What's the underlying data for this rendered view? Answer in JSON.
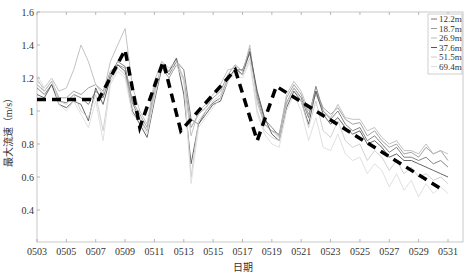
{
  "chart_data": {
    "type": "line",
    "title": "",
    "xlabel": "日期",
    "ylabel": "最大流速（m/s）",
    "ylim": [
      0.2,
      1.6
    ],
    "xlim": [
      "0503",
      "0531"
    ],
    "grid": false,
    "legend_position": "upper right",
    "x_ticks": [
      "0503",
      "0505",
      "0507",
      "0509",
      "0511",
      "0513",
      "0515",
      "0517",
      "0519",
      "0521",
      "0523",
      "0525",
      "0527",
      "0529",
      "0531"
    ],
    "y_ticks": [
      0.4,
      0.6,
      0.8,
      1,
      1.2,
      1.4,
      1.6
    ],
    "y_tick_labels": [
      "0.4",
      "0.6",
      "0.8",
      "1",
      "1.2",
      "1.4",
      "1.6"
    ],
    "x_day_values": [
      3,
      3.5,
      4,
      4.5,
      5,
      5.5,
      6,
      6.5,
      7,
      7.5,
      8,
      8.5,
      9,
      9.5,
      10,
      10.5,
      11,
      11.5,
      12,
      12.5,
      13,
      13.5,
      14,
      14.5,
      15,
      15.5,
      16,
      16.5,
      17,
      17.5,
      18,
      18.5,
      19,
      19.5,
      20,
      20.5,
      21,
      21.5,
      22,
      22.5,
      23,
      23.5,
      24,
      24.5,
      25,
      25.5,
      26,
      26.5,
      27,
      27.5,
      28,
      28.5,
      29,
      29.5,
      30,
      30.5,
      31
    ],
    "series": [
      {
        "name": "12.2m",
        "color": "#777777",
        "values": [
          1.14,
          1.1,
          1.16,
          1.06,
          1.05,
          1.1,
          1.08,
          1.04,
          1.12,
          1.08,
          1.22,
          1.3,
          1.27,
          1.05,
          0.95,
          0.88,
          1.1,
          1.28,
          1.22,
          1.3,
          1.25,
          0.95,
          0.92,
          1.0,
          1.05,
          1.08,
          1.2,
          1.25,
          1.25,
          1.35,
          1.1,
          0.95,
          0.9,
          0.85,
          1.05,
          1.14,
          1.08,
          0.96,
          1.15,
          1.0,
          0.95,
          1.0,
          0.92,
          0.88,
          0.9,
          0.82,
          0.85,
          0.8,
          0.75,
          0.78,
          0.72,
          0.72,
          0.7,
          0.72,
          0.68,
          0.7,
          0.66
        ]
      },
      {
        "name": "18.7m",
        "color": "#999999",
        "values": [
          1.16,
          1.12,
          1.18,
          1.08,
          1.08,
          1.12,
          1.1,
          1.14,
          1.16,
          1.12,
          1.24,
          1.28,
          1.26,
          1.06,
          0.98,
          0.9,
          1.14,
          1.26,
          1.2,
          1.28,
          1.2,
          0.9,
          0.98,
          1.02,
          1.08,
          1.12,
          1.22,
          1.28,
          1.24,
          1.38,
          1.08,
          0.92,
          0.88,
          0.86,
          1.08,
          1.16,
          1.1,
          0.98,
          1.12,
          1.02,
          0.98,
          1.02,
          0.95,
          0.92,
          0.93,
          0.85,
          0.88,
          0.82,
          0.78,
          0.8,
          0.74,
          0.75,
          0.72,
          0.78,
          0.74,
          0.76,
          0.7
        ]
      },
      {
        "name": "26.9m",
        "color": "#bbbbbb",
        "values": [
          1.18,
          1.14,
          1.2,
          1.12,
          1.14,
          1.25,
          1.4,
          1.3,
          1.16,
          1.1,
          1.3,
          1.4,
          1.5,
          1.15,
          1.0,
          0.92,
          1.18,
          1.3,
          1.24,
          1.32,
          1.18,
          0.85,
          1.0,
          1.04,
          1.1,
          1.16,
          1.25,
          1.26,
          1.22,
          1.4,
          1.05,
          0.92,
          0.88,
          0.84,
          1.1,
          1.18,
          1.12,
          1.0,
          1.1,
          1.0,
          0.96,
          1.04,
          0.96,
          0.95,
          0.95,
          0.88,
          0.9,
          0.84,
          0.8,
          0.82,
          0.76,
          0.76,
          0.74,
          0.8,
          0.74,
          0.76,
          0.74
        ]
      },
      {
        "name": "37.6m",
        "color": "#555555",
        "values": [
          1.1,
          1.08,
          1.16,
          1.04,
          1.02,
          1.06,
          1.04,
          0.94,
          1.14,
          1.04,
          1.2,
          1.28,
          1.24,
          1.0,
          0.92,
          0.84,
          1.06,
          1.26,
          1.24,
          1.32,
          1.1,
          0.68,
          0.92,
          0.98,
          1.04,
          1.06,
          1.18,
          1.26,
          1.22,
          1.36,
          1.12,
          0.96,
          0.86,
          0.82,
          1.02,
          1.12,
          1.06,
          0.92,
          1.12,
          0.98,
          0.92,
          0.96,
          0.9,
          0.86,
          0.88,
          0.8,
          0.82,
          0.78,
          0.72,
          0.74,
          0.7,
          0.7,
          0.68,
          0.66,
          0.64,
          0.62,
          0.6
        ]
      },
      {
        "name": "51.5m",
        "color": "#cccccc",
        "values": [
          1.2,
          1.12,
          1.18,
          1.06,
          1.04,
          1.1,
          1.0,
          0.96,
          1.1,
          0.88,
          1.18,
          1.26,
          1.22,
          1.02,
          0.96,
          0.88,
          1.1,
          1.3,
          1.26,
          1.3,
          1.2,
          0.6,
          0.94,
          1.0,
          1.06,
          1.1,
          1.2,
          1.24,
          1.22,
          1.32,
          1.0,
          0.88,
          0.84,
          0.82,
          1.04,
          1.14,
          1.06,
          0.9,
          1.06,
          0.88,
          0.84,
          0.94,
          0.82,
          0.78,
          0.8,
          0.7,
          0.76,
          0.72,
          0.64,
          0.7,
          0.62,
          0.66,
          0.6,
          0.62,
          0.58,
          0.6,
          0.56
        ]
      },
      {
        "name": "69.4m",
        "color": "#dddddd",
        "values": [
          1.22,
          1.14,
          1.2,
          1.04,
          1.0,
          1.06,
          0.98,
          0.9,
          1.06,
          0.82,
          1.16,
          1.24,
          1.2,
          0.98,
          0.94,
          0.86,
          1.08,
          1.28,
          1.24,
          1.28,
          1.18,
          0.56,
          0.9,
          0.96,
          1.02,
          1.08,
          1.18,
          1.22,
          1.2,
          1.3,
          0.98,
          0.86,
          0.8,
          0.78,
          1.0,
          1.1,
          1.0,
          0.82,
          0.96,
          0.78,
          0.76,
          0.86,
          0.74,
          0.7,
          0.72,
          0.62,
          0.68,
          0.64,
          0.54,
          0.62,
          0.52,
          0.58,
          0.48,
          0.56,
          0.5,
          0.54,
          0.5
        ]
      }
    ],
    "trend_line": {
      "name": "trend",
      "style": "dashed-thick",
      "color": "#000000",
      "points": [
        [
          3,
          1.07
        ],
        [
          7.2,
          1.07
        ],
        [
          9,
          1.37
        ],
        [
          10,
          0.9
        ],
        [
          11.6,
          1.3
        ],
        [
          12.8,
          0.88
        ],
        [
          16.5,
          1.25
        ],
        [
          18,
          0.82
        ],
        [
          19.3,
          1.15
        ],
        [
          30.5,
          0.53
        ]
      ]
    }
  }
}
